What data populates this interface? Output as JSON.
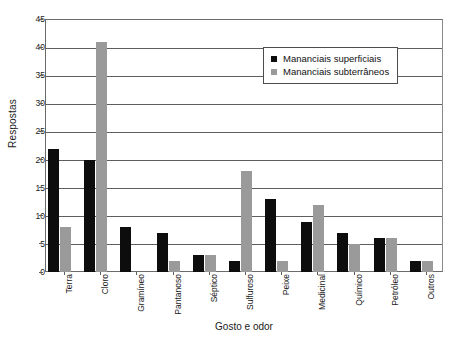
{
  "chart_data": {
    "type": "bar",
    "title": "",
    "xlabel": "Gosto e odor",
    "ylabel": "Respostas",
    "ylim": [
      0,
      45
    ],
    "ytick_step": 5,
    "yticks": [
      0,
      5,
      10,
      15,
      20,
      25,
      30,
      35,
      40,
      45
    ],
    "grid": "horizontal",
    "legend_position": "top-right-inside",
    "categories": [
      "Terra",
      "Cloro",
      "Gramíneo",
      "Pantanoso",
      "Séptico",
      "Sulfuroso",
      "Peixe",
      "Medicinal",
      "Químico",
      "Petróleo",
      "Outros"
    ],
    "series": [
      {
        "name": "Mananciais superficiais",
        "color": "#0d0d0d",
        "values": [
          22,
          20,
          8,
          7,
          3,
          2,
          13,
          9,
          7,
          6,
          2
        ]
      },
      {
        "name": "Mananciais subterrâneos",
        "color": "#9a9a9a",
        "values": [
          8,
          41,
          0,
          2,
          3,
          18,
          2,
          12,
          5,
          6,
          2
        ]
      }
    ]
  }
}
